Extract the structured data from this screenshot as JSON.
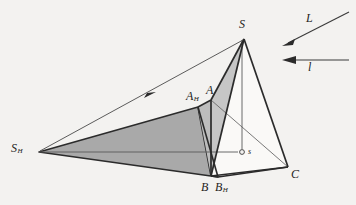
{
  "figure": {
    "background_color": "#f3f2f0",
    "stroke_color": "#2b2b2b",
    "thin_stroke_color": "#5a5a5a",
    "shadow_fill": "#a9a9a9",
    "face_fill_light": "#c9c9c9",
    "face_fill_lighter": "#bdbdbd",
    "white_fill": "#f7f6f4"
  },
  "points": {
    "S": {
      "x": 244,
      "y": 39,
      "label": "S"
    },
    "A": {
      "x": 211,
      "y": 100,
      "label": "A"
    },
    "B": {
      "x": 211,
      "y": 176,
      "label": "B"
    },
    "C": {
      "x": 288,
      "y": 167,
      "label": "C"
    },
    "SH": {
      "x": 39,
      "y": 152,
      "label": "S",
      "sub": "H"
    },
    "AH": {
      "x": 198,
      "y": 107,
      "label": "A",
      "sub": "H"
    },
    "BH": {
      "x": 218,
      "y": 177,
      "label": "B",
      "sub": "H"
    },
    "s": {
      "x": 242,
      "y": 152,
      "label": "s"
    }
  },
  "labels": {
    "S": {
      "text": "S",
      "x": 239,
      "y": 20
    },
    "A": {
      "text": "A",
      "x": 207,
      "y": 85
    },
    "AH": {
      "text": "A",
      "sub": "H",
      "x": 188,
      "y": 91
    },
    "B": {
      "text": "B",
      "x": 203,
      "y": 182
    },
    "BH": {
      "text": "B",
      "sub": "H",
      "x": 216,
      "y": 182
    },
    "C": {
      "text": "C",
      "x": 291,
      "y": 170
    },
    "SH": {
      "text": "S",
      "sub": "H",
      "x": 12,
      "y": 142
    },
    "s": {
      "text": "s",
      "x": 248,
      "y": 148
    },
    "L": {
      "text": "L",
      "x": 308,
      "y": 14
    },
    "l": {
      "text": "l",
      "x": 309,
      "y": 63
    }
  },
  "arrows": {
    "L": {
      "label": "L",
      "from": {
        "x": 349,
        "y": 12
      },
      "to": {
        "x": 283,
        "y": 45
      },
      "direction": "down-left"
    },
    "l": {
      "label": "l",
      "from": {
        "x": 349,
        "y": 60
      },
      "to": {
        "x": 283,
        "y": 60
      },
      "direction": "left"
    },
    "ray": {
      "from": {
        "x": 40,
        "y": 151
      },
      "to": {
        "x": 243,
        "y": 40
      },
      "direction": "up-right",
      "arrow_at": {
        "x": 152,
        "y": 94
      }
    }
  },
  "shapes": {
    "shadow_triangle": "S_H - A_H - B_H",
    "face_SAB": "S - A - B",
    "face_SAC_hidden": "S - A - C",
    "face_SBC": "S - B - C",
    "base_ABC": "A - B - C",
    "wedge_A_AH_B": "A - A_H - B",
    "drop_line": "S - s",
    "ground_line": "S_H - s"
  }
}
